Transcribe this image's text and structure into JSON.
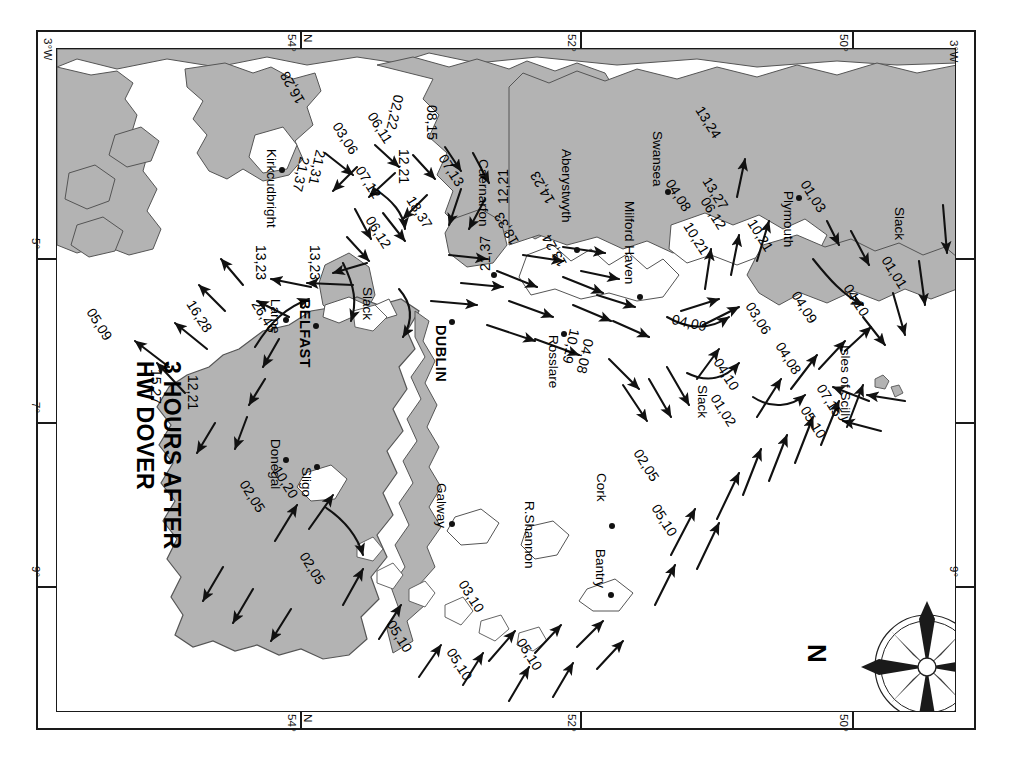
{
  "title": {
    "line1": "3 HOURS AFTER",
    "line2": "HW DOVER"
  },
  "compass": {
    "north_label": "N",
    "icon": "compass-rose-icon"
  },
  "graticule": {
    "top": [
      {
        "label": "3°W",
        "x": 44
      },
      {
        "label": "54°",
        "x": 290
      },
      {
        "label": "N",
        "x": 303
      },
      {
        "label": "52°",
        "x": 568
      },
      {
        "label": "50°",
        "x": 840
      }
    ],
    "bottom": [
      {
        "label": "54°",
        "x": 290
      },
      {
        "label": "N",
        "x": 303
      },
      {
        "label": "52°",
        "x": 568
      },
      {
        "label": "50°",
        "x": 840
      }
    ],
    "left": [
      {
        "label": "5°",
        "y": 243
      },
      {
        "label": "7°",
        "y": 408
      },
      {
        "label": "9°",
        "y": 572
      }
    ],
    "right": [
      {
        "label": "3°W",
        "y": 50
      },
      {
        "label": "9°",
        "y": 572
      }
    ]
  },
  "places": [
    {
      "name": "Kirkcudbright",
      "x": 258,
      "y": 152,
      "dot": true,
      "style": "place"
    },
    {
      "name": "Caernarfon",
      "x": 470,
      "y": 164,
      "dot": true,
      "style": "place"
    },
    {
      "name": "Aberystwyth",
      "x": 553,
      "y": 155,
      "dot": true,
      "style": "place"
    },
    {
      "name": "Swansea",
      "x": 644,
      "y": 140,
      "dot": true,
      "style": "place"
    },
    {
      "name": "Milford Haven",
      "x": 616,
      "y": 236,
      "dot": true,
      "style": "place"
    },
    {
      "name": "Plymouth",
      "x": 775,
      "y": 183,
      "dot": true,
      "style": "place"
    },
    {
      "name": "Isles of Scilly",
      "x": 832,
      "y": 349,
      "dot": false,
      "style": "place"
    },
    {
      "name": "Larne",
      "x": 262,
      "y": 288,
      "dot": true,
      "style": "place"
    },
    {
      "name": "BELFAST",
      "x": 292,
      "y": 292,
      "dot": true,
      "style": "place cap"
    },
    {
      "name": "DUBLIN",
      "x": 428,
      "y": 316,
      "dot": true,
      "style": "place cap"
    },
    {
      "name": "Rosslare",
      "x": 540,
      "y": 330,
      "dot": true,
      "style": "place"
    },
    {
      "name": "Donegal",
      "x": 262,
      "y": 437,
      "dot": true,
      "style": "place"
    },
    {
      "name": "Sligo",
      "x": 293,
      "y": 453,
      "dot": true,
      "style": "place"
    },
    {
      "name": "Galway",
      "x": 428,
      "y": 483,
      "dot": true,
      "style": "place"
    },
    {
      "name": "R.Shannon",
      "x": 516,
      "y": 510,
      "dot": false,
      "style": "place"
    },
    {
      "name": "Cork",
      "x": 588,
      "y": 465,
      "dot": true,
      "style": "place"
    },
    {
      "name": "Bantry",
      "x": 587,
      "y": 540,
      "dot": true,
      "style": "place"
    }
  ],
  "rates": [
    {
      "value": "16,28",
      "x": 176,
      "y": 290
    },
    {
      "value": "05,09",
      "x": 76,
      "y": 297
    },
    {
      "value": "15,27",
      "x": 143,
      "y": 365
    },
    {
      "value": "12,21",
      "x": 180,
      "y": 370
    },
    {
      "value": "10,20",
      "x": 262,
      "y": 460
    },
    {
      "value": "02,05",
      "x": 229,
      "y": 472
    },
    {
      "value": "02,05",
      "x": 289,
      "y": 545
    },
    {
      "value": "05,10",
      "x": 376,
      "y": 615
    },
    {
      "value": "05,10",
      "x": 436,
      "y": 643
    },
    {
      "value": "05,10",
      "x": 506,
      "y": 633
    },
    {
      "value": "03,10",
      "x": 448,
      "y": 575
    },
    {
      "value": "26,46",
      "x": 241,
      "y": 290
    },
    {
      "value": "13,23",
      "x": 248,
      "y": 243
    },
    {
      "value": "13,23",
      "x": 302,
      "y": 243
    },
    {
      "value": "21,37",
      "x": 292,
      "y": 172
    },
    {
      "value": "21,31",
      "x": 308,
      "y": 165
    },
    {
      "value": "16,28",
      "x": 273,
      "y": 112
    },
    {
      "value": "03,06",
      "x": 322,
      "y": 128
    },
    {
      "value": "06,11",
      "x": 357,
      "y": 118
    },
    {
      "value": "07,12",
      "x": 345,
      "y": 172
    },
    {
      "value": "02,22",
      "x": 386,
      "y": 104
    },
    {
      "value": "12,21",
      "x": 391,
      "y": 158
    },
    {
      "value": "08,15",
      "x": 419,
      "y": 112
    },
    {
      "value": "07,13",
      "x": 428,
      "y": 158
    },
    {
      "value": "18,37",
      "x": 396,
      "y": 200
    },
    {
      "value": "06,12",
      "x": 355,
      "y": 220
    },
    {
      "value": "12,21",
      "x": 474,
      "y": 213
    },
    {
      "value": "18,33",
      "x": 487,
      "y": 257
    },
    {
      "value": "14,23",
      "x": 523,
      "y": 216
    },
    {
      "value": "21,37",
      "x": 456,
      "y": 280
    },
    {
      "value": "13,24",
      "x": 535,
      "y": 279
    },
    {
      "value": "10,19",
      "x": 562,
      "y": 340
    },
    {
      "value": "04,09",
      "x": 653,
      "y": 320
    },
    {
      "value": "04,08",
      "x": 576,
      "y": 350
    },
    {
      "value": "02,05",
      "x": 623,
      "y": 455
    },
    {
      "value": "05,10",
      "x": 641,
      "y": 510
    },
    {
      "value": "01,02",
      "x": 700,
      "y": 400
    },
    {
      "value": "04,10",
      "x": 703,
      "y": 364
    },
    {
      "value": "03,06",
      "x": 735,
      "y": 308
    },
    {
      "value": "04,08",
      "x": 765,
      "y": 348
    },
    {
      "value": "07,15",
      "x": 806,
      "y": 390
    },
    {
      "value": "05,10",
      "x": 790,
      "y": 412
    },
    {
      "value": "04,09",
      "x": 781,
      "y": 297
    },
    {
      "value": "04,10",
      "x": 833,
      "y": 290
    },
    {
      "value": "01,01",
      "x": 871,
      "y": 262
    },
    {
      "value": "01,03",
      "x": 790,
      "y": 186
    },
    {
      "value": "10,21",
      "x": 673,
      "y": 228
    },
    {
      "value": "06,12",
      "x": 690,
      "y": 203
    },
    {
      "value": "04,08",
      "x": 655,
      "y": 185
    },
    {
      "value": "13,27",
      "x": 692,
      "y": 183
    },
    {
      "value": "13,24",
      "x": 685,
      "y": 112
    },
    {
      "value": "10,21",
      "x": 737,
      "y": 225
    }
  ],
  "slack_labels": [
    {
      "value": "Slack",
      "x": 354,
      "y": 280
    },
    {
      "value": "Slack",
      "x": 689,
      "y": 378
    },
    {
      "value": "Slack",
      "x": 886,
      "y": 200
    }
  ],
  "colors": {
    "land": "#b3b3b3",
    "land_stroke": "#555555",
    "sea": "#ffffff",
    "ink": "#111111",
    "frame": "#1a1a1a"
  }
}
